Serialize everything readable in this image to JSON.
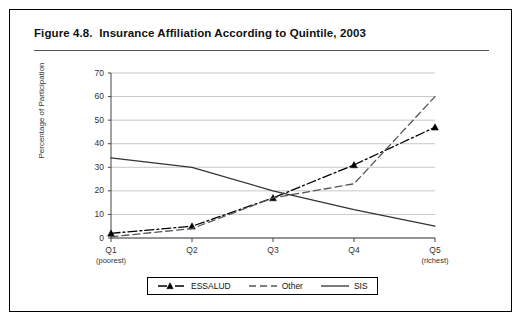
{
  "figure": {
    "title": "Figure 4.8.  Insurance Affiliation According to Quintile, 2003"
  },
  "chart_data": {
    "type": "line",
    "title": "Figure 4.8.  Insurance Affiliation According to Quintile, 2003",
    "xlabel": "",
    "ylabel": "Percentage of Participation",
    "categories": [
      "Q1",
      "Q2",
      "Q3",
      "Q4",
      "Q5"
    ],
    "category_sublabels": [
      "(poorest)",
      "",
      "",
      "",
      "(richest)"
    ],
    "ylim": [
      0,
      70
    ],
    "yticks": [
      0,
      10,
      20,
      30,
      40,
      50,
      60,
      70
    ],
    "grid": true,
    "legend_position": "bottom",
    "series": [
      {
        "name": "ESSALUD",
        "values": [
          2,
          5,
          17,
          31,
          47
        ],
        "style": "dash-dot",
        "marker": "triangle",
        "color": "#000000"
      },
      {
        "name": "Other",
        "values": [
          0.5,
          4,
          17,
          23,
          60
        ],
        "style": "dashed",
        "marker": "none",
        "color": "#555555"
      },
      {
        "name": "SIS",
        "values": [
          34,
          30,
          20,
          12,
          5
        ],
        "style": "solid",
        "marker": "none",
        "color": "#333333"
      }
    ]
  },
  "colors": {
    "frame": "#000000",
    "grid": "#b9b9b9",
    "axis": "#444444",
    "text": "#222222"
  }
}
